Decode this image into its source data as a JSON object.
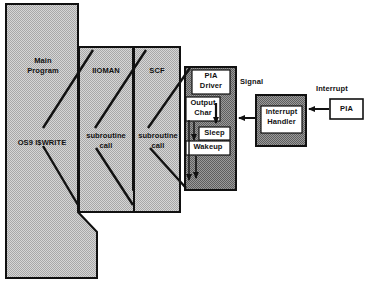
{
  "diagram": {
    "colors": {
      "light_fill": "#c3c3c3",
      "dark_fill": "#858585",
      "white_fill": "#ffffff",
      "stroke": "#111111",
      "background": "#ffffff"
    },
    "columns": [
      {
        "id": "main-program",
        "top_label": "Main\nProgram",
        "bottom_label": "OS9 I$WRITE",
        "fill": "light"
      },
      {
        "id": "ioman",
        "top_label": "IIOMAN",
        "bottom_label": "subroutine\ncall",
        "fill": "light"
      },
      {
        "id": "scf",
        "top_label": "SCF",
        "bottom_label": "subroutine\ncall",
        "fill": "light"
      }
    ],
    "pia_driver": {
      "id": "pia-driver",
      "fill": "dark",
      "boxes": [
        {
          "id": "pia-driver-title",
          "label": "PIA\nDriver"
        },
        {
          "id": "output-char",
          "label": "Output\nChar"
        },
        {
          "id": "sleep",
          "label": "Sleep"
        },
        {
          "id": "wakeup",
          "label": "Wakeup"
        }
      ]
    },
    "interrupt_handler": {
      "id": "interrupt-handler",
      "fill": "dark",
      "label": "Interrupt\nHandler"
    },
    "pia_device": {
      "id": "pia-device",
      "fill": "white",
      "label": "PIA"
    },
    "edge_labels": [
      {
        "id": "signal",
        "label": "Signal"
      },
      {
        "id": "interrupt",
        "label": "Interrupt"
      }
    ]
  }
}
